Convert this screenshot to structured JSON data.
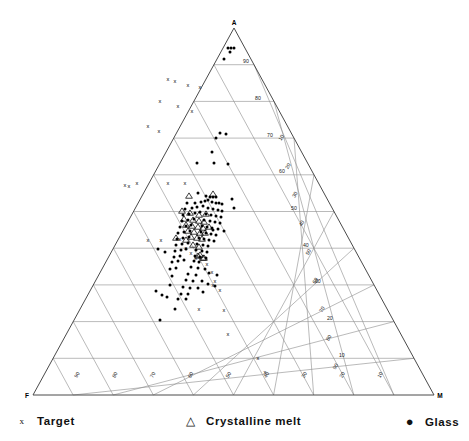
{
  "chart_data": {
    "type": "scatter",
    "subtype": "ternary",
    "title": "",
    "vertices": [
      {
        "id": "A",
        "label": "A",
        "position": "top"
      },
      {
        "id": "F",
        "label": "F",
        "position": "bottom-left"
      },
      {
        "id": "M",
        "label": "M",
        "position": "bottom-right"
      }
    ],
    "grid": {
      "divisions": 10,
      "on": true,
      "tick_labels_horizontal": [
        "90",
        "80",
        "70",
        "60",
        "50",
        "40",
        "30",
        "20",
        "10"
      ],
      "tick_labels_right_diagonal": [
        "90",
        "80",
        "70",
        "60",
        "50",
        "40",
        "30",
        "20",
        "10"
      ],
      "tick_labels_bottom": [
        "90",
        "80",
        "70",
        "60",
        "50",
        "40",
        "30",
        "20",
        "10"
      ]
    },
    "legend": {
      "position": "bottom",
      "entries": [
        {
          "name": "Target",
          "marker": "x-marker",
          "glyph": "x",
          "color": "#000000"
        },
        {
          "name": "Crystalline melt",
          "marker": "triangle-marker",
          "glyph": "△",
          "color": "#000000"
        },
        {
          "name": "Glass",
          "marker": "dot-marker",
          "glyph": "●",
          "color": "#000000"
        }
      ]
    },
    "series": [
      {
        "name": "Target",
        "marker": "x-marker",
        "points": [
          [
            168,
            79
          ],
          [
            175,
            81
          ],
          [
            188,
            85
          ],
          [
            200,
            87
          ],
          [
            160,
            101
          ],
          [
            178,
            106
          ],
          [
            192,
            111
          ],
          [
            148,
            126
          ],
          [
            159,
            131
          ],
          [
            125,
            185
          ],
          [
            129,
            186
          ],
          [
            137,
            183
          ],
          [
            168,
            183
          ],
          [
            185,
            183
          ],
          [
            148,
            240
          ],
          [
            161,
            240
          ],
          [
            180,
            239
          ],
          [
            186,
            248
          ],
          [
            191,
            253
          ],
          [
            196,
            258
          ],
          [
            207,
            264
          ],
          [
            212,
            272
          ],
          [
            215,
            281
          ],
          [
            213,
            285
          ],
          [
            220,
            290
          ],
          [
            199,
            309
          ],
          [
            224,
            310
          ],
          [
            228,
            334
          ],
          [
            258,
            358
          ],
          [
            265,
            372
          ]
        ]
      },
      {
        "name": "Crystalline melt",
        "marker": "triangle-marker",
        "points": [
          [
            189,
            196
          ],
          [
            213,
            194
          ],
          [
            182,
            211
          ],
          [
            190,
            213
          ],
          [
            199,
            215
          ],
          [
            206,
            214
          ],
          [
            184,
            219
          ],
          [
            193,
            220
          ],
          [
            199,
            221
          ],
          [
            204,
            222
          ],
          [
            186,
            225
          ],
          [
            192,
            226
          ],
          [
            198,
            227
          ],
          [
            203,
            228
          ],
          [
            209,
            227
          ],
          [
            188,
            231
          ],
          [
            194,
            232
          ],
          [
            200,
            233
          ],
          [
            205,
            233
          ],
          [
            191,
            237
          ],
          [
            197,
            238
          ],
          [
            202,
            239
          ],
          [
            176,
            238
          ],
          [
            186,
            240
          ],
          [
            193,
            245
          ],
          [
            199,
            247
          ],
          [
            198,
            256
          ],
          [
            203,
            258
          ],
          [
            204,
            258
          ],
          [
            200,
            255
          ]
        ]
      },
      {
        "name": "Glass",
        "marker": "dot-marker",
        "points": [
          [
            228,
            48
          ],
          [
            231,
            48
          ],
          [
            234,
            48
          ],
          [
            230,
            52
          ],
          [
            224,
            59
          ],
          [
            220,
            133
          ],
          [
            226,
            134
          ],
          [
            216,
            138
          ],
          [
            212,
            152
          ],
          [
            197,
            163
          ],
          [
            214,
            163
          ],
          [
            228,
            164
          ],
          [
            198,
            193
          ],
          [
            206,
            196
          ],
          [
            210,
            197
          ],
          [
            213,
            197
          ],
          [
            216,
            197
          ],
          [
            232,
            199
          ],
          [
            187,
            203
          ],
          [
            195,
            203
          ],
          [
            201,
            202
          ],
          [
            205,
            201
          ],
          [
            208,
            200
          ],
          [
            212,
            202
          ],
          [
            216,
            203
          ],
          [
            219,
            203
          ],
          [
            222,
            204
          ],
          [
            185,
            209
          ],
          [
            192,
            208
          ],
          [
            197,
            207
          ],
          [
            203,
            206
          ],
          [
            208,
            208
          ],
          [
            213,
            209
          ],
          [
            218,
            210
          ],
          [
            222,
            211
          ],
          [
            183,
            215
          ],
          [
            189,
            214
          ],
          [
            195,
            213
          ],
          [
            200,
            212
          ],
          [
            206,
            214
          ],
          [
            211,
            215
          ],
          [
            216,
            216
          ],
          [
            221,
            217
          ],
          [
            182,
            221
          ],
          [
            188,
            220
          ],
          [
            194,
            219
          ],
          [
            204,
            220
          ],
          [
            210,
            221
          ],
          [
            215,
            222
          ],
          [
            220,
            223
          ],
          [
            180,
            227
          ],
          [
            186,
            226
          ],
          [
            191,
            225
          ],
          [
            202,
            226
          ],
          [
            207,
            227
          ],
          [
            212,
            228
          ],
          [
            218,
            229
          ],
          [
            178,
            233
          ],
          [
            184,
            232
          ],
          [
            190,
            231
          ],
          [
            201,
            232
          ],
          [
            206,
            233
          ],
          [
            211,
            234
          ],
          [
            216,
            235
          ],
          [
            177,
            239
          ],
          [
            183,
            238
          ],
          [
            189,
            237
          ],
          [
            199,
            238
          ],
          [
            204,
            239
          ],
          [
            209,
            240
          ],
          [
            214,
            241
          ],
          [
            176,
            245
          ],
          [
            182,
            244
          ],
          [
            188,
            243
          ],
          [
            197,
            244
          ],
          [
            203,
            245
          ],
          [
            208,
            246
          ],
          [
            175,
            251
          ],
          [
            181,
            250
          ],
          [
            186,
            249
          ],
          [
            196,
            250
          ],
          [
            202,
            251
          ],
          [
            207,
            252
          ],
          [
            174,
            257
          ],
          [
            180,
            256
          ],
          [
            195,
            256
          ],
          [
            200,
            257
          ],
          [
            206,
            258
          ],
          [
            172,
            262
          ],
          [
            178,
            261
          ],
          [
            184,
            260
          ],
          [
            194,
            261
          ],
          [
            199,
            262
          ],
          [
            170,
            269
          ],
          [
            176,
            268
          ],
          [
            191,
            267
          ],
          [
            198,
            268
          ],
          [
            205,
            269
          ],
          [
            188,
            274
          ],
          [
            196,
            275
          ],
          [
            186,
            280
          ],
          [
            193,
            281
          ],
          [
            202,
            281
          ],
          [
            183,
            287
          ],
          [
            190,
            288
          ],
          [
            198,
            288
          ],
          [
            181,
            294
          ],
          [
            188,
            294
          ],
          [
            178,
            299
          ],
          [
            186,
            299
          ],
          [
            156,
            291
          ],
          [
            213,
            230
          ],
          [
            224,
            231
          ],
          [
            234,
            208
          ],
          [
            158,
            249
          ],
          [
            165,
            252
          ],
          [
            172,
            276
          ],
          [
            170,
            285
          ],
          [
            162,
            295
          ],
          [
            167,
            297
          ],
          [
            209,
            273
          ],
          [
            217,
            275
          ],
          [
            208,
            284
          ],
          [
            215,
            286
          ],
          [
            203,
            292
          ],
          [
            175,
            309
          ],
          [
            160,
            320
          ]
        ]
      }
    ]
  },
  "geometry": {
    "apex": [
      234,
      28
    ],
    "left": [
      33,
      395
    ],
    "right": [
      434,
      395
    ]
  }
}
